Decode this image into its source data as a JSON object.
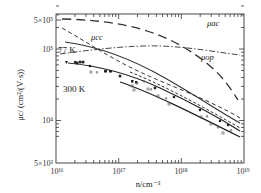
{
  "chart_data": {
    "type": "line",
    "title": "",
    "xlabel": "n/cm⁻³",
    "ylabel": "μc/ (cm²/(V·s))",
    "xscale": "log",
    "yscale": "log",
    "xlim": [
      1e+16,
      1e+19
    ],
    "ylim": [
      5000,
      500000
    ],
    "x_tick_labels": [
      "10¹⁶",
      "10¹⁷",
      "10¹⁸",
      "10¹⁹"
    ],
    "y_tick_labels": [
      "5×10³",
      "10⁴",
      "10⁵",
      "5×10⁵"
    ],
    "grid": false,
    "legend": "inline annotations",
    "series": [
      {
        "name": "μac",
        "style": "long-dash",
        "x": [
          1e+16,
          1e+17,
          1e+18,
          1e+19
        ],
        "y": [
          490000,
          420000,
          200000,
          48000
        ]
      },
      {
        "name": "μcc",
        "style": "short-dash",
        "x": [
          1e+16,
          1e+17,
          1e+18,
          1e+19
        ],
        "y": [
          330000,
          140000,
          60000,
          25000
        ]
      },
      {
        "name": "μop",
        "style": "dash-dot",
        "x": [
          1e+16,
          1e+17,
          1e+18,
          1e+19
        ],
        "y": [
          90000,
          108000,
          120000,
          98000
        ]
      },
      {
        "name": "77 K",
        "style": "solid",
        "x": [
          2e+16,
          1e+17,
          1e+18,
          1e+19
        ],
        "y": [
          140000,
          100000,
          42000,
          13000
        ]
      },
      {
        "name": "77 K (dashed)",
        "style": "dashed",
        "x": [
          1e+17,
          1e+18,
          1e+19
        ],
        "y": [
          120000,
          48000,
          15000
        ]
      },
      {
        "name": "300 K",
        "style": "solid-with-markers",
        "x": [
          2e+16,
          1e+17,
          1e+18,
          1e+19
        ],
        "y": [
          70000,
          52000,
          27000,
          11000
        ]
      },
      {
        "name": "300 K fit (lower)",
        "style": "solid",
        "x": [
          1e+17,
          1e+18,
          1e+19
        ],
        "y": [
          45000,
          22000,
          9000
        ]
      }
    ],
    "annotations": [
      "μac",
      "μcc",
      "μop",
      "77 K",
      "300 K"
    ],
    "scatter_points_open": [
      [
        9e+16,
        55000
      ],
      [
        1.1e+17,
        57000
      ],
      [
        2.5e+17,
        44000
      ],
      [
        3e+17,
        38000
      ],
      [
        4e+17,
        40000
      ],
      [
        5e+17,
        32000
      ],
      [
        7e+17,
        34000
      ],
      [
        2.5e+18,
        26000
      ],
      [
        3e+18,
        22000
      ],
      [
        4e+18,
        21000
      ],
      [
        6e+18,
        17000
      ],
      [
        7e+18,
        15000
      ]
    ],
    "scatter_points_filled": [
      [
        2.3e+16,
        71000
      ],
      [
        3.5e+16,
        69000
      ],
      [
        4e+16,
        70000
      ],
      [
        6e+16,
        62000
      ],
      [
        2e+17,
        52000
      ],
      [
        4.5e+17,
        47000
      ],
      [
        6e+17,
        46000
      ],
      [
        1.5e+18,
        27000
      ]
    ]
  },
  "labels": {
    "ylabel": "μc/ (cm²/(V·s))",
    "xlabel": "n/cm⁻³",
    "ann_ac": "μac",
    "ann_cc": "μcc",
    "ann_op": "μop",
    "ann_77": "77 K",
    "ann_300": "300 K",
    "y5e5": "5×10⁵",
    "y1e5": "10⁵",
    "y1e4": "10⁴",
    "y5e3": "5×10³",
    "x16": "10¹⁶",
    "x17": "10¹⁷",
    "x18": "10¹⁸",
    "x19": "10¹⁹"
  }
}
